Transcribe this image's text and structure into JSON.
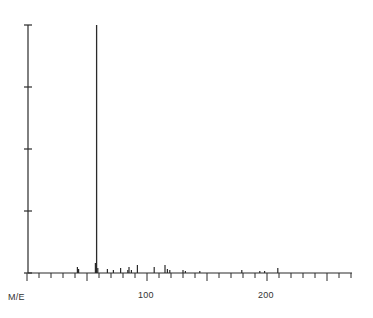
{
  "chart_data": {
    "type": "bar",
    "title": "",
    "xlabel": "M/E",
    "ylabel": "",
    "x_ticks": [
      100,
      200
    ],
    "xlim": [
      0,
      270
    ],
    "ylim": [
      0,
      100
    ],
    "y_tick_count": 5,
    "grid": false,
    "legend": "none",
    "peaks": [
      {
        "mz": 42,
        "intensity": 2.4
      },
      {
        "mz": 43,
        "intensity": 1.6
      },
      {
        "mz": 57,
        "intensity": 4.0
      },
      {
        "mz": 58,
        "intensity": 100
      },
      {
        "mz": 59,
        "intensity": 2.0
      },
      {
        "mz": 67,
        "intensity": 1.6
      },
      {
        "mz": 72,
        "intensity": 1.2
      },
      {
        "mz": 78,
        "intensity": 2.0
      },
      {
        "mz": 84,
        "intensity": 1.2
      },
      {
        "mz": 85,
        "intensity": 2.4
      },
      {
        "mz": 87,
        "intensity": 1.2
      },
      {
        "mz": 92,
        "intensity": 3.2
      },
      {
        "mz": 106,
        "intensity": 2.4
      },
      {
        "mz": 115,
        "intensity": 3.2
      },
      {
        "mz": 117,
        "intensity": 1.6
      },
      {
        "mz": 119,
        "intensity": 1.2
      },
      {
        "mz": 130,
        "intensity": 1.2
      },
      {
        "mz": 132,
        "intensity": 0.8
      },
      {
        "mz": 144,
        "intensity": 0.8
      },
      {
        "mz": 179,
        "intensity": 1.2
      },
      {
        "mz": 194,
        "intensity": 0.8
      },
      {
        "mz": 198,
        "intensity": 0.8
      },
      {
        "mz": 209,
        "intensity": 2.0
      }
    ]
  },
  "axis": {
    "x_label": "M/E",
    "tick_100": "100",
    "tick_200": "200"
  }
}
